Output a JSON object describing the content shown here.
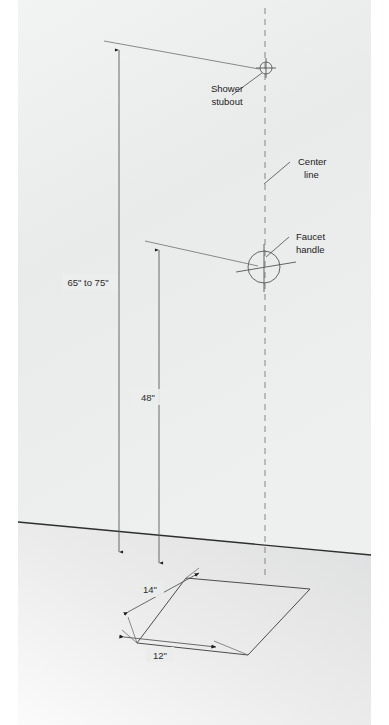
{
  "diagram": {
    "surfaces": {
      "wall": {
        "name": "wall",
        "color": "#eceded"
      },
      "floor": {
        "name": "floor",
        "color": "#e4e5e6"
      },
      "floor_edge_color": "#2e2e2e"
    },
    "dimensions": [
      {
        "id": "shower-stubout-height",
        "label": "65\" to 75\"",
        "orientation": "vertical",
        "label_x": 88,
        "label_y": 283
      },
      {
        "id": "faucet-handle-height",
        "label": "48\"",
        "orientation": "vertical",
        "label_x": 148,
        "label_y": 398
      },
      {
        "id": "shower-pan-depth",
        "label": "14\"",
        "orientation": "diagonal",
        "label_x": 150,
        "label_y": 590
      },
      {
        "id": "shower-pan-width",
        "label": "12\"",
        "orientation": "diagonal",
        "label_x": 160,
        "label_y": 657
      }
    ],
    "callouts": [
      {
        "id": "shower-stubout",
        "line1": "Shower",
        "line2": "stubout",
        "x": 227,
        "y": 90
      },
      {
        "id": "center-line",
        "line1": "Center",
        "line2": "line",
        "x": 298,
        "y": 164
      },
      {
        "id": "faucet-handle",
        "line1": "Faucet",
        "line2": "handle",
        "x": 296,
        "y": 238
      }
    ],
    "fixtures": [
      {
        "id": "shower-stubout-symbol",
        "type": "crosshair-circle",
        "cx": 266,
        "cy": 68,
        "r": 6
      },
      {
        "id": "faucet-handle-symbol",
        "type": "crosshair-circle",
        "cx": 264,
        "cy": 267,
        "r": 16
      }
    ]
  }
}
